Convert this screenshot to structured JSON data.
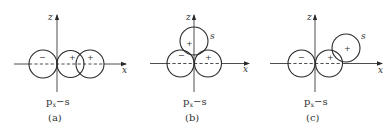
{
  "figure": {
    "panels": [
      {
        "id": "a",
        "caption": "(a)",
        "label_main": "p",
        "label_sub": "x",
        "label_rest": "−s",
        "axis_z": "z",
        "axis_x": "x",
        "orbital_signs": [
          "−",
          "+",
          "+"
        ],
        "description": "p_x and s orbitals overlapping along x-axis"
      },
      {
        "id": "b",
        "caption": "(b)",
        "label_main": "p",
        "label_sub": "x",
        "label_rest": "−s",
        "axis_z": "z",
        "axis_x": "x",
        "orbital_signs": [
          "−",
          "+",
          "+"
        ],
        "s_label": "s",
        "description": "s orbital positioned on z-axis above p_x orbital (zero net overlap)"
      },
      {
        "id": "c",
        "caption": "(c)",
        "label_main": "p",
        "label_sub": "x",
        "label_rest": "−s",
        "axis_z": "z",
        "axis_x": "x",
        "orbital_signs": [
          "−",
          "+",
          "+"
        ],
        "s_label": "s",
        "description": "s orbital positioned diagonally, partial overlap with p_x positive lobe"
      }
    ]
  }
}
